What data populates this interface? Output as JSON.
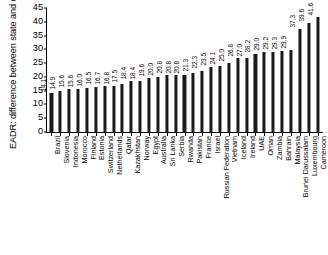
{
  "chart_data": {
    "type": "bar",
    "title": "",
    "xlabel": "",
    "ylabel": "EADR: difference between state and observed trade data (%)",
    "ylim": [
      0,
      45
    ],
    "yticks": [
      0,
      5,
      10,
      15,
      20,
      25,
      30,
      35,
      40,
      45
    ],
    "grid": false,
    "legend": "none",
    "bar_color": "#1a1a1a",
    "value_labels": true,
    "categories": [
      "Brazil",
      "Slovenia",
      "Indonesia",
      "Morocco",
      "Finland",
      "Estonia",
      "Switzerland",
      "Netherlands",
      "Qatar",
      "Kazakhstan",
      "Norway",
      "Egypt",
      "Australia",
      "Sri Lanka",
      "Serbia",
      "Rwanda",
      "Pakistan",
      "France",
      "Israel",
      "Russian Federation",
      "Vietnam",
      "Iceland",
      "Ireland",
      "UAE",
      "Oman",
      "Zambia",
      "Bahrain",
      "Malaysia",
      "Brunei Darussalam",
      "Luxembourg",
      "Cameroon"
    ],
    "values": [
      14.1,
      14.9,
      15.6,
      15.6,
      16.0,
      16.5,
      16.7,
      16.8,
      17.5,
      18.4,
      18.4,
      19.6,
      20.0,
      20.8,
      20.8,
      20.8,
      21.3,
      22.3,
      23.5,
      24.1,
      25.0,
      26.8,
      27.0,
      28.2,
      29.0,
      29.2,
      29.3,
      29.9,
      37.3,
      39.6,
      41.6
    ],
    "value_label_strings": [
      "14.1",
      "14.9",
      "15.6",
      "15.6",
      "16.0",
      "16.5",
      "16.7",
      "16.8",
      "17.5",
      "18.4",
      "18.4",
      "19.6",
      "20.0",
      "20.8",
      "20.8",
      "20.8",
      "21.3",
      "22.3",
      "23.5",
      "24.1",
      "25.0",
      "26.8",
      "27.0",
      "28.2",
      "29.0",
      "29.2",
      "29.3",
      "29.9",
      "37.3",
      "39.6",
      "41.6"
    ]
  }
}
